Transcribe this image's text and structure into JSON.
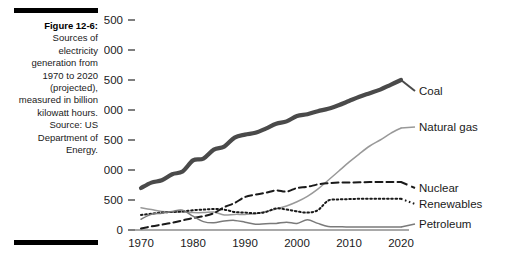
{
  "caption": {
    "label": "Figure 12-6:",
    "body": "Sources of electricity generation from 1970 to 2020 (projected), measured in billion kilowatt hours.",
    "source": "Source: US Department of Energy."
  },
  "chart_data": {
    "type": "line",
    "title": "",
    "xlabel": "",
    "ylabel": "",
    "xlim": [
      1970,
      2020
    ],
    "ylim": [
      0,
      3500
    ],
    "grid": false,
    "legend_position": "right-of-plot-inline",
    "x_ticks": [
      "1970",
      "1980",
      "1990",
      "2000",
      "2010",
      "2020"
    ],
    "x_tick_values": [
      1970,
      1980,
      1990,
      2000,
      2010,
      2020
    ],
    "y_ticks": [
      "0",
      "500",
      "1,000",
      "1,500",
      "2,000",
      "2,500",
      "3,000",
      "3,500"
    ],
    "y_tick_values": [
      0,
      500,
      1000,
      1500,
      2000,
      2500,
      3000,
      3500
    ],
    "units": "billion kilowatt hours",
    "x": [
      1970,
      1972,
      1974,
      1976,
      1978,
      1980,
      1982,
      1984,
      1986,
      1988,
      1990,
      1992,
      1994,
      1996,
      1998,
      2000,
      2002,
      2004,
      2006,
      2008,
      2010,
      2012,
      2014,
      2016,
      2018,
      2020
    ],
    "series": [
      {
        "name": "Coal",
        "label": "Coal",
        "color": "#4a4a4a",
        "style": "solid-thick",
        "values": [
          700,
          790,
          830,
          930,
          975,
          1160,
          1190,
          1340,
          1390,
          1540,
          1590,
          1620,
          1690,
          1770,
          1810,
          1900,
          1930,
          1980,
          2020,
          2080,
          2150,
          2220,
          2280,
          2340,
          2420,
          2500
        ]
      },
      {
        "name": "Natural gas",
        "label": "Natural gas",
        "color": "#999999",
        "style": "solid-thin",
        "values": [
          370,
          340,
          310,
          300,
          300,
          290,
          290,
          300,
          250,
          260,
          260,
          270,
          310,
          350,
          400,
          470,
          560,
          680,
          830,
          980,
          1130,
          1270,
          1400,
          1500,
          1610,
          1700
        ]
      },
      {
        "name": "Nuclear",
        "label": "Nuclear",
        "color": "#1a1a1a",
        "style": "dashed",
        "values": [
          25,
          60,
          90,
          120,
          160,
          200,
          230,
          280,
          380,
          450,
          550,
          590,
          620,
          660,
          640,
          700,
          720,
          760,
          780,
          790,
          790,
          795,
          800,
          800,
          800,
          800
        ]
      },
      {
        "name": "Renewables",
        "label": "Renewables",
        "color": "#1a1a1a",
        "style": "dotted",
        "values": [
          250,
          270,
          290,
          300,
          310,
          330,
          340,
          350,
          340,
          300,
          290,
          280,
          300,
          360,
          340,
          310,
          290,
          330,
          490,
          510,
          515,
          520,
          520,
          520,
          520,
          520
        ]
      },
      {
        "name": "Petroleum",
        "label": "Petroleum",
        "color": "#7a7a7a",
        "style": "solid-thin",
        "values": [
          180,
          260,
          280,
          310,
          330,
          230,
          140,
          120,
          150,
          160,
          130,
          95,
          105,
          110,
          130,
          110,
          170,
          110,
          60,
          55,
          50,
          50,
          50,
          50,
          50,
          50
        ]
      }
    ]
  }
}
